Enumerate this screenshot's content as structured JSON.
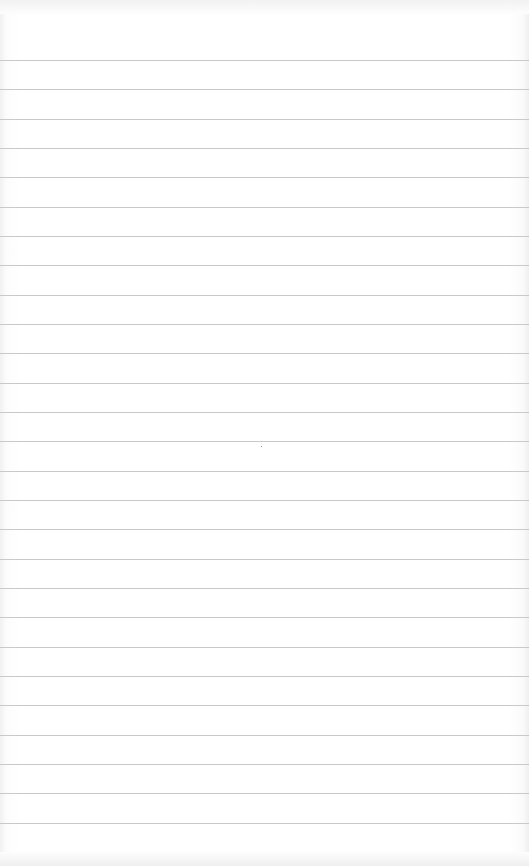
{
  "page": {
    "type": "lined-paper",
    "background_color": "#ffffff",
    "rule_color": "#c9c9c9",
    "rule_count": 27,
    "first_rule_y": 60,
    "rule_spacing": 29.33
  }
}
